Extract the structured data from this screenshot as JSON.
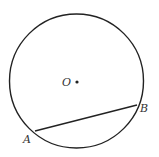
{
  "diagram": {
    "type": "geometry-circle-chord",
    "circle": {
      "cx": 76.5,
      "cy": 81,
      "r": 67,
      "stroke": "#222222"
    },
    "center": {
      "x": 77,
      "y": 82,
      "label": "O"
    },
    "chord": {
      "from": {
        "x": 35,
        "y": 131,
        "label": "A"
      },
      "to": {
        "x": 137,
        "y": 105,
        "label": "B"
      }
    }
  }
}
